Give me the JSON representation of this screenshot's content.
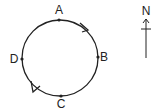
{
  "diagram": {
    "type": "circular-path",
    "circle": {
      "cx": 60,
      "cy": 58,
      "r": 38
    },
    "points": [
      {
        "label": "A",
        "x": 59,
        "y": 20,
        "label_x": 59,
        "label_y": 14
      },
      {
        "label": "B",
        "x": 98,
        "y": 57,
        "label_x": 104,
        "label_y": 61
      },
      {
        "label": "C",
        "x": 61,
        "y": 96,
        "label_x": 61,
        "label_y": 108
      },
      {
        "label": "D",
        "x": 22,
        "y": 59,
        "label_x": 14,
        "label_y": 63
      }
    ],
    "direction": "clockwise",
    "compass": {
      "label": "N",
      "direction": "north"
    }
  },
  "colors": {
    "stroke": "#222222",
    "background": "#ffffff"
  }
}
